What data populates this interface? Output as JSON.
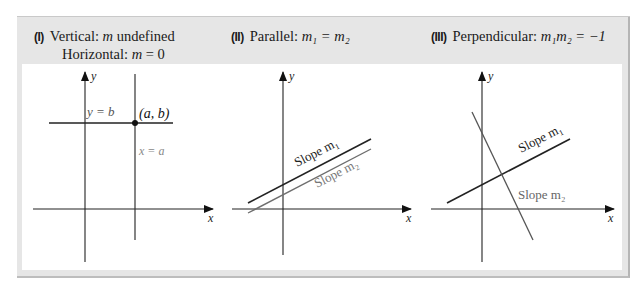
{
  "panels": [
    {
      "id": "I",
      "numeral": "(I)",
      "line1_prefix": "Vertical: ",
      "line1_var": "m",
      "line1_suffix": " undefined",
      "line2_prefix": "Horizontal: ",
      "line2_var": "m",
      "line2_suffix": " = 0",
      "labels": {
        "y_axis": "y",
        "x_axis": "x",
        "horizontal_line": "y = b",
        "point": "(a, b)",
        "vertical_line": "x = a"
      }
    },
    {
      "id": "II",
      "numeral": "(II)",
      "title_prefix": "Parallel: ",
      "title_math": "m₁ = m₂",
      "labels": {
        "y_axis": "y",
        "x_axis": "x",
        "line1": "Slope m₁",
        "line2": "Slope m₂"
      }
    },
    {
      "id": "III",
      "numeral": "(III)",
      "title_prefix": "Perpendicular: ",
      "title_math": "m₁m₂ = −1",
      "labels": {
        "y_axis": "y",
        "x_axis": "x",
        "line1": "Slope m₁",
        "line2": "Slope m₂"
      }
    }
  ],
  "colors": {
    "frame_bg": "#e6e6e6",
    "panel_bg": "#ffffff",
    "dark_line": "#222222",
    "gray_line": "#6e6e6e",
    "gray_text": "#777777"
  }
}
